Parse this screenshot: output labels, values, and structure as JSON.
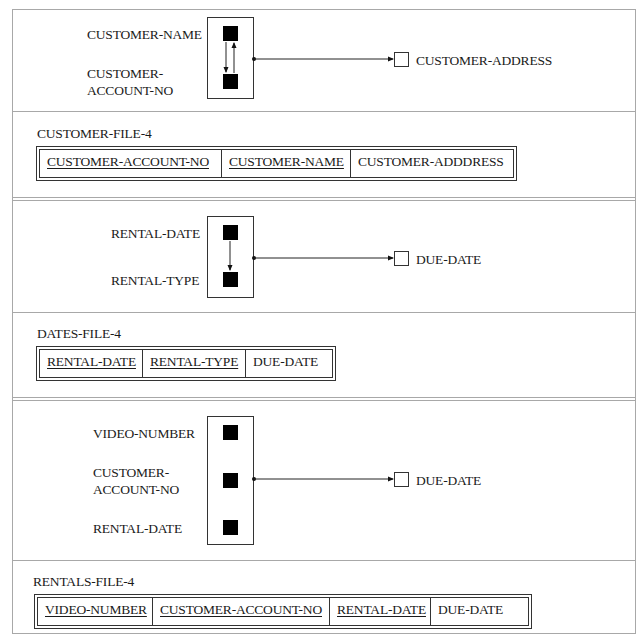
{
  "diagram": {
    "sections": [
      {
        "id": "customer",
        "determinants": [
          "CUSTOMER-NAME",
          "CUSTOMER-ACCOUNT-NO"
        ],
        "determinant_labels": [
          [
            "CUSTOMER-NAME"
          ],
          [
            "CUSTOMER-",
            "ACCOUNT-NO"
          ]
        ],
        "internal_arrows": [
          {
            "from": "CUSTOMER-NAME",
            "to": "CUSTOMER-ACCOUNT-NO"
          },
          {
            "from": "CUSTOMER-ACCOUNT-NO",
            "to": "CUSTOMER-NAME"
          }
        ],
        "dependent": "CUSTOMER-ADDRESS",
        "file": {
          "name": "CUSTOMER-FILE-4",
          "columns": [
            {
              "label": "CUSTOMER-ACCOUNT-NO",
              "key": true
            },
            {
              "label": "CUSTOMER-NAME",
              "key": true
            },
            {
              "label": "CUSTOMER-ADDDRESS",
              "key": false
            }
          ]
        }
      },
      {
        "id": "dates",
        "determinants": [
          "RENTAL-DATE",
          "RENTAL-TYPE"
        ],
        "determinant_labels": [
          [
            "RENTAL-DATE"
          ],
          [
            "RENTAL-TYPE"
          ]
        ],
        "internal_arrows": [
          {
            "from": "RENTAL-DATE",
            "to": "RENTAL-TYPE"
          }
        ],
        "dependent": "DUE-DATE",
        "file": {
          "name": "DATES-FILE-4",
          "columns": [
            {
              "label": "RENTAL-DATE",
              "key": true
            },
            {
              "label": "RENTAL-TYPE",
              "key": true
            },
            {
              "label": "DUE-DATE",
              "key": false
            }
          ]
        }
      },
      {
        "id": "rentals",
        "determinants": [
          "VIDEO-NUMBER",
          "CUSTOMER-ACCOUNT-NO",
          "RENTAL-DATE"
        ],
        "determinant_labels": [
          [
            "VIDEO-NUMBER"
          ],
          [
            "CUSTOMER-",
            "ACCOUNT-NO"
          ],
          [
            "RENTAL-DATE"
          ]
        ],
        "internal_arrows": [],
        "dependent": "DUE-DATE",
        "file": {
          "name": "RENTALS-FILE-4",
          "columns": [
            {
              "label": "VIDEO-NUMBER",
              "key": true
            },
            {
              "label": "CUSTOMER-ACCOUNT-NO",
              "key": true
            },
            {
              "label": "RENTAL-DATE",
              "key": true
            },
            {
              "label": "DUE-DATE",
              "key": false
            }
          ]
        }
      }
    ]
  }
}
